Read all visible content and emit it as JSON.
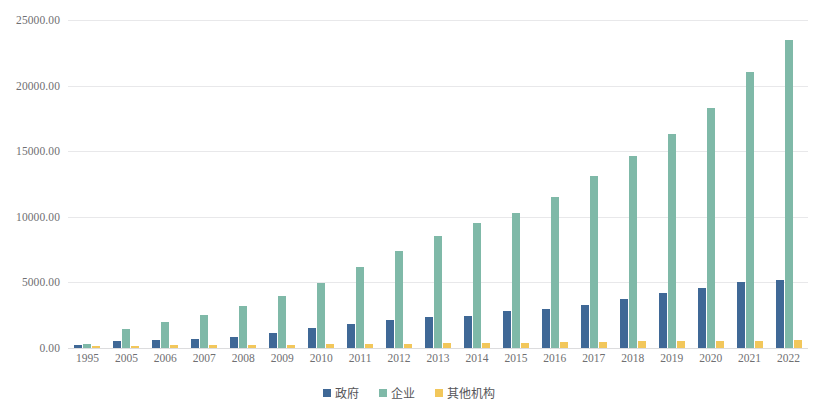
{
  "chart_data": {
    "type": "bar",
    "title": "",
    "subtitle": "",
    "xlabel": "",
    "ylabel": "",
    "grid": true,
    "legend_position": "bottom",
    "ylim": [
      0,
      25000
    ],
    "yticks": [
      0,
      5000,
      10000,
      15000,
      20000,
      25000
    ],
    "ytick_labels": [
      "0.00",
      "5000.00",
      "10000.00",
      "15000.00",
      "20000.00",
      "25000.00"
    ],
    "categories": [
      "1995",
      "2005",
      "2006",
      "2007",
      "2008",
      "2009",
      "2010",
      "2011",
      "2012",
      "2013",
      "2014",
      "2015",
      "2016",
      "2017",
      "2018",
      "2019",
      "2020",
      "2021",
      "2022"
    ],
    "series": [
      {
        "name": "政府",
        "color": "#3f6896",
        "values": [
          210,
          513,
          610,
          720,
          840,
          1150,
          1520,
          1850,
          2100,
          2330,
          2450,
          2800,
          2980,
          3300,
          3750,
          4200,
          4550,
          5020,
          5160
        ]
      },
      {
        "name": "企业",
        "color": "#7fb9a8",
        "values": [
          300,
          1480,
          2020,
          2540,
          3170,
          4000,
          4920,
          6180,
          7370,
          8500,
          9500,
          10300,
          11500,
          13100,
          14600,
          16300,
          18300,
          21000,
          23500
        ]
      },
      {
        "name": "其他机构",
        "color": "#f2c75b",
        "values": [
          70,
          180,
          200,
          220,
          240,
          260,
          290,
          310,
          340,
          370,
          390,
          420,
          440,
          470,
          500,
          520,
          540,
          570,
          600
        ]
      }
    ]
  },
  "legend": {
    "items": [
      {
        "label": "政府",
        "color": "#3f6896"
      },
      {
        "label": "企业",
        "color": "#7fb9a8"
      },
      {
        "label": "其他机构",
        "color": "#f2c75b"
      }
    ]
  }
}
